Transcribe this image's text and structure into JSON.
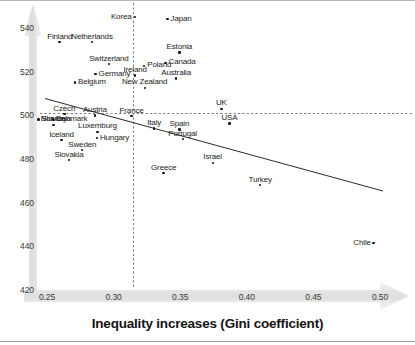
{
  "chart_data": {
    "type": "scatter",
    "title": "",
    "xlabel": "Inequality increases (Gini coefficient)",
    "ylabel": "",
    "xlim": [
      0.2305,
      0.5145
    ],
    "ylim": [
      420,
      546
    ],
    "xticks": [
      "0.25",
      "0.30",
      "0.35",
      "0.40",
      "0.45",
      "0.50"
    ],
    "xtick_values": [
      0.25,
      0.3,
      0.35,
      0.4,
      0.45,
      0.5
    ],
    "yticks": [
      "420",
      "440",
      "460",
      "480",
      "500",
      "520",
      "540"
    ],
    "ytick_values": [
      420,
      440,
      460,
      480,
      500,
      520,
      540
    ],
    "grid": false,
    "legend": null,
    "reference_lines": [
      {
        "orientation": "vertical",
        "value": 0.316,
        "style": "dashed"
      },
      {
        "orientation": "horizontal",
        "value": 500,
        "style": "dashed"
      }
    ],
    "trendline": {
      "style": "solid",
      "x_start": 0.2318,
      "y_start": 507.4,
      "x_end": 0.5036,
      "y_end": 463.5
    },
    "points": [
      {
        "label": "Korea",
        "x": 0.316,
        "y": 545.0,
        "label_pos": "left"
      },
      {
        "label": "Japan",
        "x": 0.3405,
        "y": 544.1,
        "label_pos": "right"
      },
      {
        "label": "Finland",
        "x": 0.2595,
        "y": 533.5,
        "label_pos": "above"
      },
      {
        "label": "Netherlands",
        "x": 0.284,
        "y": 533.5,
        "label_pos": "above"
      },
      {
        "label": "Estonia",
        "x": 0.3495,
        "y": 528.7,
        "label_pos": "above"
      },
      {
        "label": "Canada",
        "x": 0.339,
        "y": 524.0,
        "label_pos": "right"
      },
      {
        "label": "Switzerland",
        "x": 0.2965,
        "y": 523.5,
        "label_pos": "above"
      },
      {
        "label": "Poland",
        "x": 0.323,
        "y": 522.6,
        "label_pos": "right"
      },
      {
        "label": "Germany",
        "x": 0.2865,
        "y": 518.8,
        "label_pos": "right"
      },
      {
        "label": "Ireland",
        "x": 0.316,
        "y": 518.3,
        "label_pos": "above"
      },
      {
        "label": "Australia",
        "x": 0.347,
        "y": 516.9,
        "label_pos": "above"
      },
      {
        "label": "Belgium",
        "x": 0.271,
        "y": 515.0,
        "label_pos": "right"
      },
      {
        "label": "New Zealand",
        "x": 0.3235,
        "y": 512.6,
        "label_pos": "above"
      },
      {
        "label": "UK",
        "x": 0.381,
        "y": 503.0,
        "label_pos": "above"
      },
      {
        "label": "Czech",
        "x": 0.263,
        "y": 500.5,
        "label_pos": "above"
      },
      {
        "label": "Austria",
        "x": 0.286,
        "y": 500.0,
        "label_pos": "above"
      },
      {
        "label": "Slovenia",
        "x": 0.2435,
        "y": 498.1,
        "label_pos": "right"
      },
      {
        "label": "Denmark",
        "x": 0.2545,
        "y": 498.1,
        "label_pos": "right"
      },
      {
        "label": "France",
        "x": 0.3135,
        "y": 499.6,
        "label_pos": "above"
      },
      {
        "label": "Norway",
        "x": 0.255,
        "y": 495.6,
        "label_pos": "above"
      },
      {
        "label": "Luxemburg",
        "x": 0.288,
        "y": 492.5,
        "label_pos": "above"
      },
      {
        "label": "Italy",
        "x": 0.3305,
        "y": 494.0,
        "label_pos": "above"
      },
      {
        "label": "Spain",
        "x": 0.3495,
        "y": 493.5,
        "label_pos": "above"
      },
      {
        "label": "Hungary",
        "x": 0.2875,
        "y": 489.6,
        "label_pos": "right"
      },
      {
        "label": "Iceland",
        "x": 0.261,
        "y": 488.7,
        "label_pos": "above"
      },
      {
        "label": "Portugal",
        "x": 0.352,
        "y": 489.1,
        "label_pos": "above"
      },
      {
        "label": "USA",
        "x": 0.387,
        "y": 496.3,
        "label_pos": "above"
      },
      {
        "label": "Sweden",
        "x": 0.2765,
        "y": 484.0,
        "label_pos": "above"
      },
      {
        "label": "Israel",
        "x": 0.3745,
        "y": 478.3,
        "label_pos": "above"
      },
      {
        "label": "Slovakia",
        "x": 0.2665,
        "y": 479.5,
        "label_pos": "above"
      },
      {
        "label": "Greece",
        "x": 0.3375,
        "y": 473.5,
        "label_pos": "above"
      },
      {
        "label": "Turkey",
        "x": 0.41,
        "y": 468.0,
        "label_pos": "above"
      },
      {
        "label": "Chile",
        "x": 0.495,
        "y": 441.5,
        "label_pos": "left"
      }
    ]
  },
  "axis": {
    "x_title": "Inequality increases (Gini coefficient)"
  }
}
